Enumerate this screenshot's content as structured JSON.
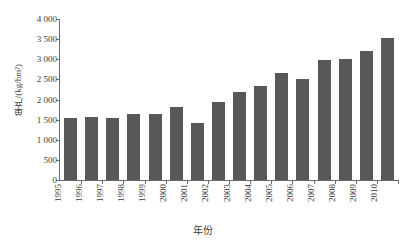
{
  "chart_data": {
    "type": "bar",
    "title": "",
    "xlabel": "年份",
    "ylabel": "单产/(kg/hm²)",
    "categories": [
      "1995",
      "1996",
      "1997",
      "1998",
      "1999",
      "2000",
      "2001",
      "2002",
      "2003",
      "2004",
      "2005",
      "2006",
      "2007",
      "2008",
      "2009",
      "2010"
    ],
    "values": [
      1530,
      1565,
      1545,
      1630,
      1645,
      1820,
      1420,
      1930,
      2175,
      2340,
      2660,
      2520,
      2990,
      2995,
      3205,
      3535
    ],
    "series": [
      {
        "name": "单产",
        "values": [
          1530,
          1565,
          1545,
          1630,
          1645,
          1820,
          1420,
          1930,
          2175,
          2340,
          2660,
          2520,
          2990,
          2995,
          3205,
          3535
        ]
      }
    ],
    "ylim": [
      0,
      4000
    ],
    "yticks": [
      0,
      500,
      1000,
      1500,
      2000,
      2500,
      3000,
      3500,
      4000
    ],
    "ytick_labels": [
      "0",
      "500",
      "1 000",
      "1 500",
      "2 000",
      "2 500",
      "3 000",
      "3 500",
      "4 000"
    ],
    "grid": false,
    "legend": false,
    "legend_position": "none",
    "bar_color": "#58585a",
    "axis_color": "#6b6b6b",
    "background_color": "#ffffff",
    "xtick_rotation": 90
  }
}
